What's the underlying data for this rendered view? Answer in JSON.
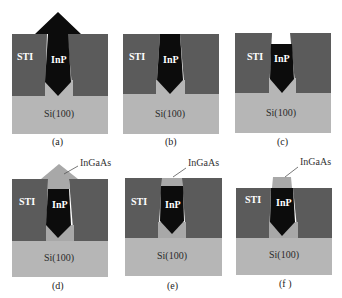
{
  "colors": {
    "sti": "#5b5b5b",
    "si": "#b6b6b6",
    "inp": "#0c0c0c",
    "ingaas": "#a8a8a8",
    "background": "#ffffff"
  },
  "labels": {
    "sti": "STI",
    "inp": "InP",
    "si": "Si(100)",
    "ingaas": "InGaAs"
  },
  "panels": [
    {
      "id": "a",
      "caption": "(a)"
    },
    {
      "id": "b",
      "caption": "(b)"
    },
    {
      "id": "c",
      "caption": "(c)"
    },
    {
      "id": "d",
      "caption": "(d)"
    },
    {
      "id": "e",
      "caption": "(e)"
    },
    {
      "id": "f",
      "caption": "(f )"
    }
  ]
}
